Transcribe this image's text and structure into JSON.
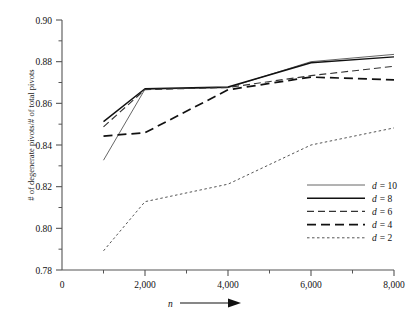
{
  "chart_data": {
    "type": "line",
    "title": "",
    "xlabel": "n",
    "ylabel": "# of degenerate pivots/# of total pivots",
    "x": [
      1000,
      2000,
      4000,
      6000,
      8000
    ],
    "xlim": [
      0,
      8000
    ],
    "ylim": [
      0.78,
      0.9
    ],
    "xticks": [
      0,
      2000,
      4000,
      6000,
      8000
    ],
    "xticklabels": [
      "0",
      "2,000",
      "4,000",
      "6,000",
      "8,000"
    ],
    "yticks": [
      0.78,
      0.8,
      0.82,
      0.84,
      0.86,
      0.88,
      0.9
    ],
    "yticklabels": [
      "0.78",
      "0.80",
      "0.82",
      "0.84",
      "0.86",
      "0.88",
      "0.90"
    ],
    "xminorticks": [
      1000,
      3000,
      5000,
      7000
    ],
    "yminorticks": [
      0.79,
      0.81,
      0.83,
      0.85,
      0.87,
      0.89
    ],
    "grid": false,
    "legend_position": "lower-right",
    "series": [
      {
        "name": "d = 10",
        "label_prefix": "d",
        "label_value": "= 10",
        "style": "solid-thin",
        "color": "#555555",
        "values": [
          0.8327,
          0.8668,
          0.8675,
          0.88,
          0.8835
        ]
      },
      {
        "name": "d = 8",
        "label_prefix": "d",
        "label_value": "= 8",
        "style": "solid-thick",
        "color": "#111111",
        "values": [
          0.8512,
          0.867,
          0.8678,
          0.8795,
          0.8823
        ]
      },
      {
        "name": "d = 6",
        "label_prefix": "d",
        "label_value": "= 6",
        "style": "dashed",
        "color": "#333333",
        "values": [
          0.8487,
          0.8666,
          0.8676,
          0.8733,
          0.8778
        ]
      },
      {
        "name": "d = 4",
        "label_prefix": "d",
        "label_value": "= 4",
        "style": "longdash",
        "color": "#111111",
        "values": [
          0.8443,
          0.8459,
          0.8665,
          0.8726,
          0.8713
        ]
      },
      {
        "name": "d = 2",
        "label_prefix": "d",
        "label_value": "= 2",
        "style": "dotted",
        "color": "#555555",
        "values": [
          0.7892,
          0.8128,
          0.8212,
          0.84,
          0.8482
        ]
      }
    ]
  },
  "axis": {
    "x_arrow_label": "n"
  }
}
